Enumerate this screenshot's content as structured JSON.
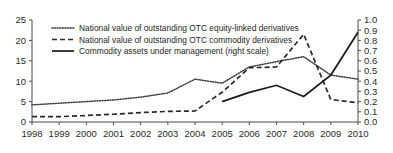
{
  "chart_data": {
    "type": "line",
    "title": "",
    "subtitle": "",
    "xlabel": "",
    "ylabel": "",
    "y2label": "",
    "grid": false,
    "legend_position": "top-left",
    "x": [
      1998,
      1999,
      2000,
      2001,
      2002,
      2003,
      2004,
      2005,
      2006,
      2007,
      2008,
      2009,
      2010
    ],
    "categories": [
      "1998",
      "1999",
      "2000",
      "2001",
      "2002",
      "2003",
      "2004",
      "2005",
      "2006",
      "2007",
      "2008",
      "2009",
      "2010"
    ],
    "ylim": [
      0,
      25
    ],
    "y2lim": [
      0.0,
      1.0
    ],
    "yticks": [
      "0",
      "5",
      "10",
      "15",
      "20",
      "25"
    ],
    "y2ticks": [
      "0.0",
      "0.1",
      "0.2",
      "0.3",
      "0.4",
      "0.5",
      "0.6",
      "0.7",
      "0.8",
      "0.9",
      "1.0"
    ],
    "series": [
      {
        "name": "National value of outstanding OTC equity-linked derivatives",
        "style": "dotted",
        "axis": "left",
        "color": "#3a3a3a",
        "values": [
          4.2,
          4.6,
          5.0,
          5.4,
          6.1,
          7.1,
          10.5,
          9.5,
          13.5,
          14.8,
          16.0,
          11.5,
          10.5
        ]
      },
      {
        "name": "National value of outstanding OTC commodity derivatives",
        "style": "dashed",
        "axis": "left",
        "color": "#2a2a2a",
        "values": [
          1.3,
          1.3,
          1.6,
          1.9,
          2.3,
          2.6,
          2.7,
          7.3,
          13.3,
          13.5,
          21.5,
          5.5,
          4.7
        ]
      },
      {
        "name": "Commodity assets under management (right scale)",
        "style": "solid",
        "axis": "right",
        "color": "#1a1a1a",
        "values": [
          null,
          null,
          null,
          null,
          null,
          null,
          null,
          0.2,
          0.29,
          0.36,
          0.25,
          0.46,
          0.88
        ]
      }
    ]
  },
  "legend": {
    "items": [
      {
        "label": "National value of outstanding OTC equity-linked derivatives",
        "style": "dotted"
      },
      {
        "label": "National value of outstanding OTC commodity derivatives",
        "style": "dashed"
      },
      {
        "label": "Commodity assets under management (right scale)",
        "style": "solid"
      }
    ]
  }
}
